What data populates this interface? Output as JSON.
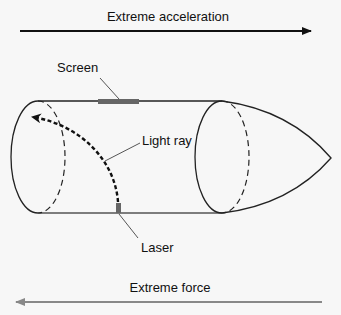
{
  "arrows": {
    "top": {
      "label": "Extreme acceleration",
      "direction": "right",
      "color": "#111111"
    },
    "bottom": {
      "label": "Extreme force",
      "direction": "left",
      "color": "#888888"
    }
  },
  "labels": {
    "screen": "Screen",
    "light_ray": "Light ray",
    "laser": "Laser"
  },
  "colors": {
    "outline": "#222222",
    "screen": "#666666",
    "laser": "#666666",
    "background": "#f7f7f7"
  }
}
